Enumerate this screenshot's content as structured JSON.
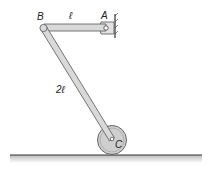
{
  "diagram": {
    "labels": {
      "point_a": "A",
      "point_b": "B",
      "point_c": "C",
      "length_ab": "ℓ",
      "length_bc": "2ℓ"
    },
    "colors": {
      "bar_fill": "#d9d9d9",
      "bar_stroke": "#555555",
      "wheel_fill": "#cfcfcf",
      "ground": "#333333"
    }
  }
}
